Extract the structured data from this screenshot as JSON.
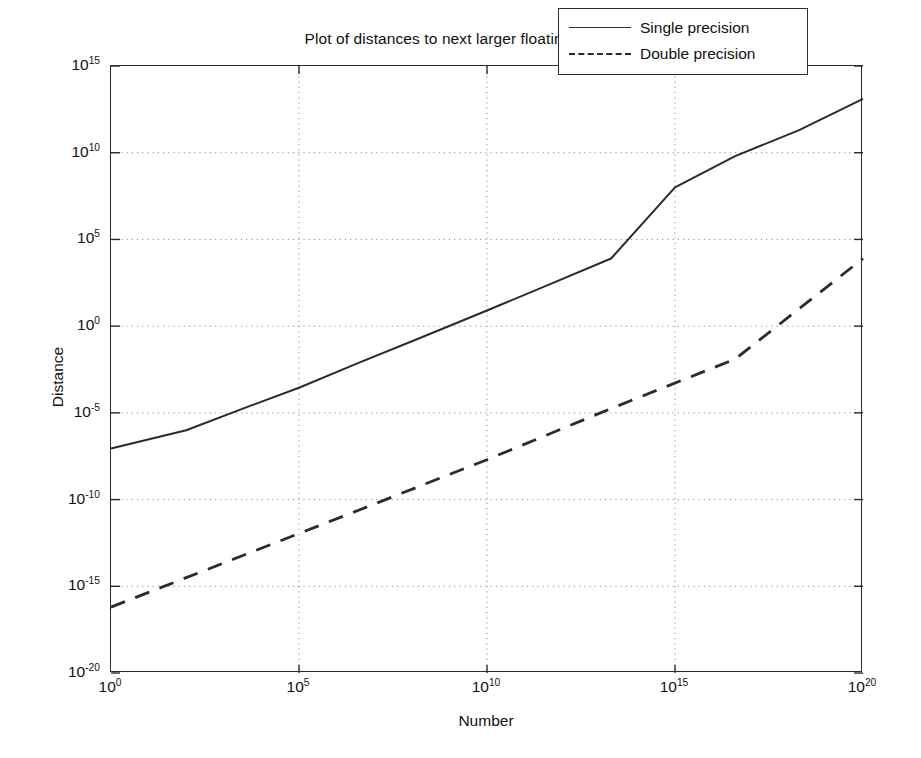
{
  "figure": {
    "width": 921,
    "height": 758,
    "background": "#ffffff",
    "line_color": "#2b2b2b",
    "grid_color": "#8d8d8d"
  },
  "xlabel": "Number",
  "ylabel": "Distance",
  "legend": {
    "position": "top-right-inside",
    "entries": [
      {
        "label": "Single precision",
        "style": "solid"
      },
      {
        "label": "Double precision",
        "style": "dashed"
      }
    ]
  },
  "xticks": [
    {
      "mantissa": "10",
      "exponent": "0"
    },
    {
      "mantissa": "10",
      "exponent": "5"
    },
    {
      "mantissa": "10",
      "exponent": "10"
    },
    {
      "mantissa": "10",
      "exponent": "15"
    },
    {
      "mantissa": "10",
      "exponent": "20"
    }
  ],
  "yticks": [
    {
      "mantissa": "10",
      "exponent": "15"
    },
    {
      "mantissa": "10",
      "exponent": "10"
    },
    {
      "mantissa": "10",
      "exponent": "5"
    },
    {
      "mantissa": "10",
      "exponent": "0"
    },
    {
      "mantissa": "10",
      "exponent": "-5"
    },
    {
      "mantissa": "10",
      "exponent": "-10"
    },
    {
      "mantissa": "10",
      "exponent": "-15"
    },
    {
      "mantissa": "10",
      "exponent": "-20"
    }
  ],
  "chart_data": {
    "type": "line",
    "title": "Plot of distances to next larger floating point number",
    "xlabel": "Number",
    "ylabel": "Distance",
    "xscale": "log",
    "yscale": "log",
    "xlim": [
      1.0,
      1e+20
    ],
    "ylim": [
      1e-20,
      1000000000000000.0
    ],
    "xlim_log10": [
      0,
      20
    ],
    "ylim_log10": [
      -20,
      15
    ],
    "grid": true,
    "legend_position": "upper right",
    "note": "Values given as log10 of each coordinate; the curves are piecewise-linear staircase approximations of the ULP (unit in the last place) spacing.",
    "series": [
      {
        "name": "Single precision",
        "style": "solid",
        "x_log10": [
          0.0,
          2.0,
          3.7,
          5.0,
          6.6,
          8.2,
          10.0,
          11.6,
          13.3,
          15.0,
          16.6,
          18.3,
          20.0
        ],
        "y_log10": [
          -7.05,
          -6.0,
          -4.6,
          -3.55,
          -2.1,
          -0.7,
          0.9,
          2.35,
          3.9,
          8.0,
          9.8,
          11.3,
          13.1
        ]
      },
      {
        "name": "Double precision",
        "style": "dashed",
        "x_log10": [
          0.0,
          3.3,
          6.6,
          10.0,
          13.3,
          16.6,
          20.0
        ],
        "y_log10": [
          -16.2,
          -13.4,
          -10.6,
          -7.7,
          -4.75,
          -1.9,
          3.9
        ]
      }
    ]
  }
}
